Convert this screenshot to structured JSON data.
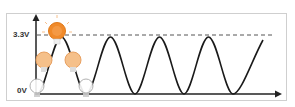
{
  "diagram": {
    "labels": {
      "high": "3.3V",
      "low": "0V"
    },
    "colors": {
      "wave": "#1a1a1a",
      "bulb_bright": "#f08a2a",
      "bulb_mid": "#f0b070",
      "bulb_off": "#bbbbbb",
      "frame": "#cfcfcf"
    },
    "bulbs": [
      {
        "state": "off",
        "position": "wave start (0V)"
      },
      {
        "state": "dim",
        "position": "rising slope"
      },
      {
        "state": "bright",
        "position": "peak (3.3V)"
      },
      {
        "state": "dim",
        "position": "falling slope"
      },
      {
        "state": "off",
        "position": "trough (0V)"
      }
    ]
  }
}
